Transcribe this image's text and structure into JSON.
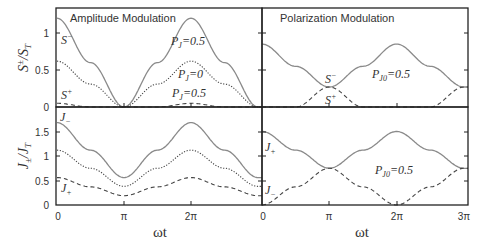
{
  "chart_data": [
    {
      "type": "line",
      "panel": "top-left",
      "title": "Amplitude Modulation",
      "xlabel": "ωt",
      "ylabel": "S±/S_T",
      "xlim": [
        0,
        3.07
      ],
      "xunit": "pi",
      "ylim": [
        0,
        1.3
      ],
      "yticks": [
        0,
        0.5,
        1
      ],
      "yticklabels": [
        "0",
        "0.5",
        "1"
      ],
      "series": [
        {
          "name": "S- (P_J=0.5)",
          "style": "solid",
          "x": [
            0,
            0.5,
            1,
            1.5,
            2,
            2.5,
            3
          ],
          "values": [
            1.2,
            0.6,
            0,
            0.6,
            1.2,
            0.6,
            0
          ]
        },
        {
          "name": "S (P_J=0)",
          "style": "dotted",
          "x": [
            0,
            0.5,
            1,
            1.5,
            2,
            2.5,
            3
          ],
          "values": [
            0.62,
            0.31,
            0,
            0.31,
            0.62,
            0.31,
            0
          ]
        },
        {
          "name": "S+ (P_J=0.5)",
          "style": "dashed",
          "x": [
            0,
            0.5,
            1,
            1.5,
            2,
            2.5,
            3
          ],
          "values": [
            0.05,
            0,
            0,
            0,
            0.05,
            0,
            0
          ]
        }
      ],
      "annotations": [
        "S-",
        "S+",
        "P_J=0.5",
        "P_J=0",
        "P_J=0.5"
      ]
    },
    {
      "type": "line",
      "panel": "top-right",
      "title": "Polarization Modulation",
      "xlabel": "ωt",
      "xlim": [
        0,
        3
      ],
      "xunit": "pi",
      "ylim": [
        0,
        1.3
      ],
      "series": [
        {
          "name": "S-",
          "style": "solid",
          "x": [
            0,
            0.5,
            1,
            1.5,
            2,
            2.5,
            3
          ],
          "values": [
            0.85,
            0.55,
            0.27,
            0.55,
            0.85,
            0.55,
            0.27
          ]
        },
        {
          "name": "S+",
          "style": "dashed",
          "x": [
            0,
            0.5,
            1,
            1.5,
            2,
            2.5,
            3
          ],
          "values": [
            0,
            0,
            0.27,
            0,
            0,
            0,
            0.27
          ]
        }
      ],
      "annotations": [
        "S-",
        "S+",
        "P_J0=0.5"
      ]
    },
    {
      "type": "line",
      "panel": "bottom-left",
      "xlabel": "ωt",
      "ylabel": "J±/J_T",
      "xlim": [
        0,
        3.07
      ],
      "xunit": "pi",
      "xticks": [
        0,
        1,
        2
      ],
      "xticklabels": [
        "0",
        "π",
        "2π"
      ],
      "ylim": [
        0,
        1.9
      ],
      "yticks": [
        0,
        0.5,
        1,
        1.5
      ],
      "yticklabels": [
        "0",
        "0.5",
        "1",
        "1.5"
      ],
      "series": [
        {
          "name": "J-",
          "style": "solid",
          "x": [
            0,
            0.5,
            1,
            1.5,
            2,
            2.5,
            3
          ],
          "values": [
            1.68,
            1.12,
            0.56,
            1.12,
            1.68,
            1.12,
            0.56
          ]
        },
        {
          "name": "J (P_J=0)",
          "style": "dotted",
          "x": [
            0,
            0.5,
            1,
            1.5,
            2,
            2.5,
            3
          ],
          "values": [
            1.12,
            0.75,
            0.38,
            0.75,
            1.12,
            0.75,
            0.38
          ]
        },
        {
          "name": "J+",
          "style": "dashed",
          "x": [
            0,
            0.5,
            1,
            1.5,
            2,
            2.5,
            3
          ],
          "values": [
            0.56,
            0.37,
            0.19,
            0.37,
            0.56,
            0.37,
            0.19
          ]
        }
      ],
      "annotations": [
        "J-",
        "J+"
      ]
    },
    {
      "type": "line",
      "panel": "bottom-right",
      "xlabel": "ωt",
      "xlim": [
        0,
        3
      ],
      "xunit": "pi",
      "xticks": [
        0,
        1,
        2,
        3
      ],
      "xticklabels": [
        "0",
        "π",
        "2π",
        "3π"
      ],
      "ylim": [
        0,
        1.9
      ],
      "series": [
        {
          "name": "J+",
          "style": "solid",
          "x": [
            0,
            0.5,
            1,
            1.5,
            2,
            2.5,
            3
          ],
          "values": [
            1.5,
            1.12,
            0.75,
            1.12,
            1.5,
            1.12,
            0.75
          ]
        },
        {
          "name": "J-",
          "style": "dashed",
          "x": [
            0,
            0.5,
            1,
            1.5,
            2,
            2.5,
            3
          ],
          "values": [
            0,
            0.37,
            0.75,
            0.37,
            0,
            0.37,
            0.75
          ]
        }
      ],
      "annotations": [
        "J+",
        "J-",
        "P_J0=0.5"
      ]
    }
  ],
  "labels": {
    "title_left": "Amplitude Modulation",
    "title_right": "Polarization Modulation",
    "ylabel_top": "S",
    "ylabel_top_sup": "±",
    "ylabel_top_den": "/S",
    "ylabel_top_sub": "T",
    "ylabel_bottom": "J",
    "ylabel_bottom_sub": "±",
    "ylabel_bottom_den": "/J",
    "ylabel_bottom_sub2": "T",
    "xlabel": "ωt",
    "tl_S_minus": "S",
    "tl_S_plus": "S",
    "tl_PJ05a": "P",
    "tl_PJ05a_sub": "J",
    "tl_PJ05a_val": "=0.5",
    "tl_PJ0": "P",
    "tl_PJ0_sub": "J",
    "tl_PJ0_val": "=0",
    "tl_PJ05b": "P",
    "tl_PJ05b_sub": "J",
    "tl_PJ05b_val": "=0.5",
    "tr_S_minus": "S",
    "tr_S_plus": "S",
    "tr_PJ0": "P",
    "tr_PJ0_sub": "J0",
    "tr_PJ0_val": "=0.5",
    "bl_J_minus": "J",
    "bl_J_plus": "J",
    "br_J_plus": "J",
    "br_J_minus": "J",
    "br_PJ0": "P",
    "br_PJ0_sub": "J0",
    "br_PJ0_val": "=0.5",
    "minus": "−",
    "plus": "+",
    "sub_minus": "−",
    "sub_plus": "+"
  },
  "ticks": {
    "top_y": [
      "0",
      "0.5",
      "1"
    ],
    "bottom_y": [
      "0",
      "0.5",
      "1",
      "1.5"
    ],
    "left_x": [
      "0",
      "π",
      "2π"
    ],
    "right_x": [
      "0",
      "π",
      "2π",
      "3π"
    ]
  },
  "colors": {
    "solid": "#8a8a8a",
    "dotted": "#444444",
    "dashed": "#444444",
    "axis": "#222222"
  }
}
